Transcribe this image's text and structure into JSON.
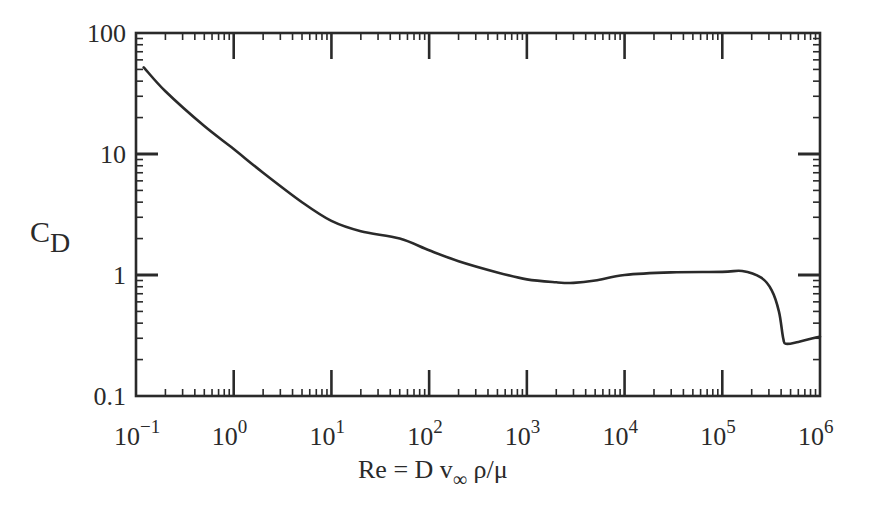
{
  "chart_data": {
    "type": "line",
    "title": "",
    "xlabel": "Re = D v∞ ρ/μ",
    "ylabel": "C_D",
    "x_scale": "log",
    "y_scale": "log",
    "xlim": [
      0.1,
      1000000
    ],
    "ylim": [
      0.1,
      100
    ],
    "grid": false,
    "legend": null,
    "x_tick_labels": [
      {
        "base": "10",
        "exp": "−1"
      },
      {
        "base": "10",
        "exp": "0"
      },
      {
        "base": "10",
        "exp": "1"
      },
      {
        "base": "10",
        "exp": "2"
      },
      {
        "base": "10",
        "exp": "3"
      },
      {
        "base": "10",
        "exp": "4"
      },
      {
        "base": "10",
        "exp": "5"
      },
      {
        "base": "10",
        "exp": "6"
      }
    ],
    "y_tick_labels": [
      "100",
      "10",
      "1",
      "0.1"
    ],
    "series": [
      {
        "name": "Drag coefficient of a sphere",
        "x": [
          0.12,
          0.2,
          0.5,
          1,
          2,
          5,
          10,
          20,
          50,
          100,
          200,
          500,
          1000,
          2000,
          3000,
          5000,
          10000,
          30000,
          100000,
          160000,
          250000,
          320000,
          380000,
          420000,
          450000,
          600000,
          1000000
        ],
        "y": [
          52,
          33,
          17,
          11,
          7,
          4,
          2.8,
          2.3,
          2.0,
          1.6,
          1.3,
          1.05,
          0.92,
          0.87,
          0.86,
          0.9,
          1.0,
          1.05,
          1.06,
          1.08,
          0.95,
          0.75,
          0.5,
          0.3,
          0.27,
          0.28,
          0.31
        ]
      }
    ]
  },
  "labels": {
    "y_axis_main": "C",
    "y_axis_sub": "D",
    "x_axis_prefix": "Re = D v",
    "x_axis_sub": "∞",
    "x_axis_suffix": " ρ/μ"
  }
}
